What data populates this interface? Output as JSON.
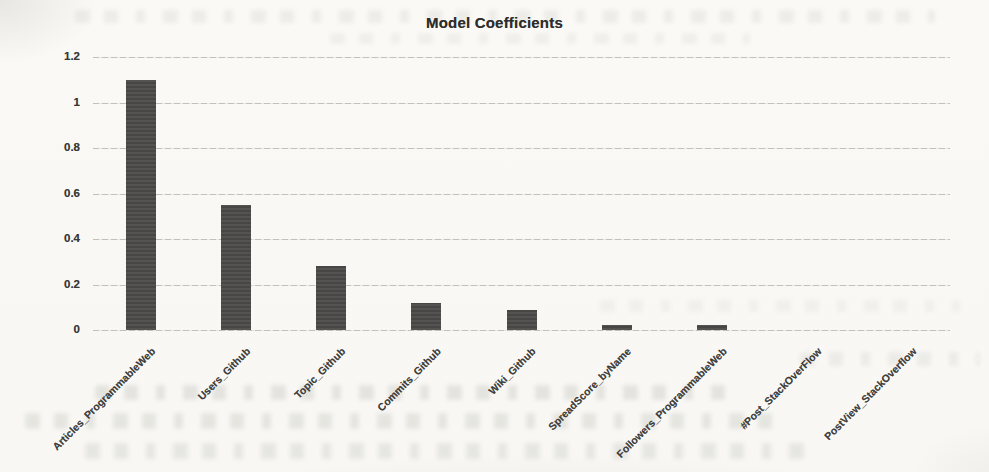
{
  "page": {
    "background_color": "#f9f8f5",
    "kind": "scanned page with embedded chart"
  },
  "chart_data": {
    "type": "bar",
    "title": "Model Coefficients",
    "categories": [
      "Articles_ProgrammableWeb",
      "Users_Github",
      "Topic_Github",
      "Commits_Github",
      "Wiki_Github",
      "SpreadScore_byName",
      "Followers_ProgrammableWeb",
      "#Post_StackOverFlow",
      "PostView_StackOverflow"
    ],
    "values": [
      1.1,
      0.55,
      0.28,
      0.12,
      0.09,
      0.02,
      0.02,
      0,
      0
    ],
    "xlabel": "",
    "ylabel": "",
    "ylim": [
      0,
      1.2
    ],
    "yticks": [
      0,
      0.2,
      0.4,
      0.6,
      0.8,
      1,
      1.2
    ],
    "ytick_labels": [
      "0",
      "0.2",
      "0.4",
      "0.6",
      "0.8",
      "1",
      "1.2"
    ],
    "grid": "horizontal",
    "legend": false,
    "bar_color": "#4b4a48",
    "gridline_color": "#94928c",
    "title_color": "#2e2d2b",
    "tick_label_color": "#393836",
    "category_label_color": "#403f3d",
    "category_label_rotation_deg": -45
  }
}
